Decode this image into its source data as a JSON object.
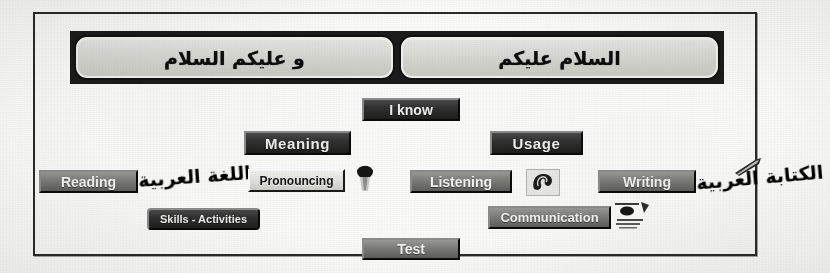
{
  "app": {
    "title": "Arabic Language Learning Menu"
  },
  "greeting": {
    "left_box": "و عليكم السلام",
    "right_box": "السلام عليكم"
  },
  "buttons": {
    "i_know": "I know",
    "meaning": "Meaning",
    "usage": "Usage",
    "reading": "Reading",
    "pronouncing": "Pronouncing",
    "listening": "Listening",
    "writing": "Writing",
    "skills_activities": "Skills - Activities",
    "communication": "Communication",
    "test": "Test"
  },
  "decorations": {
    "reading_script": "اللغة العربية",
    "writing_script": "الكتابة العربية"
  },
  "icons": {
    "pronouncing": "mouth-speaking-icon",
    "listening": "ear-icon",
    "communication": "speech-bubbles-icon",
    "writing": "pen-nib-icon"
  },
  "colors": {
    "page": "#fdfdfb",
    "frame_border": "#2a2a2a",
    "band": "#1b1b1b",
    "button_dark": "#1e1e1e",
    "button_mid": "#7d7d79",
    "button_light": "#e2e2de",
    "label_light": "#f0f0ee",
    "label_dark": "#141414"
  }
}
